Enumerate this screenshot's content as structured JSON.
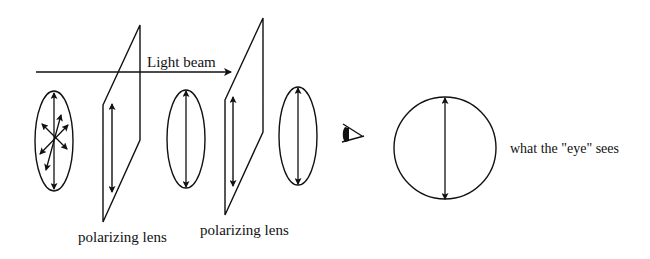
{
  "diagram": {
    "type": "polarization-illustration",
    "colors": {
      "stroke": "#111111",
      "background": "#ffffff"
    },
    "light_beam": {
      "label": "Light beam",
      "direction": "left-to-right"
    },
    "stages": [
      {
        "id": "unpolarized-light",
        "description": "Light vibrating in many directions"
      },
      {
        "id": "polarizer-1",
        "label": "polarizing lens",
        "axis": "vertical"
      },
      {
        "id": "polarized-light-1",
        "description": "Vertically polarized light"
      },
      {
        "id": "polarizer-2",
        "label": "polarizing lens",
        "axis": "vertical"
      },
      {
        "id": "polarized-light-2",
        "description": "Vertically polarized light"
      },
      {
        "id": "eye",
        "icon": "eye-icon"
      },
      {
        "id": "eye-view",
        "label": "what the \"eye\" sees"
      }
    ]
  }
}
